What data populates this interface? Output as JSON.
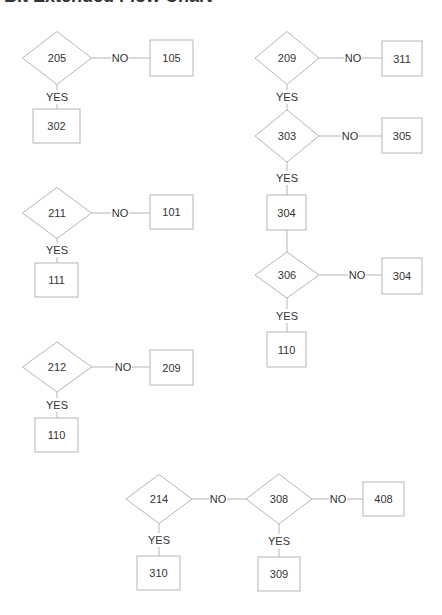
{
  "title": "Bit Extended Flow Chart",
  "colors": {
    "stroke": "#b5b5b5",
    "text": "#333333",
    "background": "#ffffff"
  },
  "nodes": [
    {
      "id": "d205",
      "type": "decision",
      "label": "205",
      "cx": 57,
      "cy": 58,
      "w": 69,
      "h": 53
    },
    {
      "id": "b105",
      "type": "process",
      "label": "105",
      "x": 150,
      "y": 40,
      "w": 43,
      "h": 36
    },
    {
      "id": "b302",
      "type": "process",
      "label": "302",
      "x": 33,
      "y": 109,
      "w": 47,
      "h": 34
    },
    {
      "id": "d211",
      "type": "decision",
      "label": "211",
      "cx": 57,
      "cy": 213,
      "w": 69,
      "h": 51
    },
    {
      "id": "b101",
      "type": "process",
      "label": "101",
      "x": 150,
      "y": 195,
      "w": 43,
      "h": 34
    },
    {
      "id": "b111",
      "type": "process",
      "label": "111",
      "x": 35,
      "y": 263,
      "w": 43,
      "h": 34
    },
    {
      "id": "d212",
      "type": "decision",
      "label": "212",
      "cx": 57,
      "cy": 367,
      "w": 69,
      "h": 50
    },
    {
      "id": "b209",
      "type": "process",
      "label": "209",
      "x": 150,
      "y": 350,
      "w": 43,
      "h": 35
    },
    {
      "id": "b110a",
      "type": "process",
      "label": "110",
      "x": 35,
      "y": 418,
      "w": 43,
      "h": 34
    },
    {
      "id": "d209",
      "type": "decision",
      "label": "209",
      "cx": 287,
      "cy": 58,
      "w": 64,
      "h": 53
    },
    {
      "id": "b311",
      "type": "process",
      "label": "311",
      "x": 382,
      "y": 41,
      "w": 40,
      "h": 35
    },
    {
      "id": "d303",
      "type": "decision",
      "label": "303",
      "cx": 287,
      "cy": 136,
      "w": 64,
      "h": 52
    },
    {
      "id": "b305",
      "type": "process",
      "label": "305",
      "x": 382,
      "y": 118,
      "w": 40,
      "h": 35
    },
    {
      "id": "b304a",
      "type": "process",
      "label": "304",
      "x": 267,
      "y": 195,
      "w": 39,
      "h": 35
    },
    {
      "id": "d306",
      "type": "decision",
      "label": "306",
      "cx": 287,
      "cy": 275,
      "w": 64,
      "h": 46
    },
    {
      "id": "b304b",
      "type": "process",
      "label": "304",
      "x": 382,
      "y": 258,
      "w": 40,
      "h": 36
    },
    {
      "id": "b110b",
      "type": "process",
      "label": "110",
      "x": 267,
      "y": 332,
      "w": 39,
      "h": 35
    },
    {
      "id": "d214",
      "type": "decision",
      "label": "214",
      "cx": 159,
      "cy": 499,
      "w": 66,
      "h": 49
    },
    {
      "id": "d308",
      "type": "decision",
      "label": "308",
      "cx": 279,
      "cy": 499,
      "w": 66,
      "h": 50
    },
    {
      "id": "b408",
      "type": "process",
      "label": "408",
      "x": 363,
      "y": 482,
      "w": 41,
      "h": 34
    },
    {
      "id": "b310",
      "type": "process",
      "label": "310",
      "x": 137,
      "y": 556,
      "w": 43,
      "h": 34
    },
    {
      "id": "b309",
      "type": "process",
      "label": "309",
      "x": 258,
      "y": 557,
      "w": 42,
      "h": 34
    }
  ],
  "edges": [
    {
      "from": "d205",
      "to": "b105",
      "label": "NO",
      "x1": 91,
      "y1": 58,
      "x2": 150,
      "y2": 58,
      "lx": 120,
      "ly": 58
    },
    {
      "from": "d205",
      "to": "b302",
      "label": "YES",
      "x1": 57,
      "y1": 85,
      "x2": 57,
      "y2": 109,
      "lx": 57,
      "ly": 97
    },
    {
      "from": "d211",
      "to": "b101",
      "label": "NO",
      "x1": 91,
      "y1": 213,
      "x2": 150,
      "y2": 213,
      "lx": 120,
      "ly": 213
    },
    {
      "from": "d211",
      "to": "b111",
      "label": "YES",
      "x1": 57,
      "y1": 238,
      "x2": 57,
      "y2": 263,
      "lx": 57,
      "ly": 250
    },
    {
      "from": "d212",
      "to": "b209",
      "label": "NO",
      "x1": 91,
      "y1": 367,
      "x2": 150,
      "y2": 367,
      "lx": 123,
      "ly": 367
    },
    {
      "from": "d212",
      "to": "b110a",
      "label": "YES",
      "x1": 57,
      "y1": 392,
      "x2": 57,
      "y2": 418,
      "lx": 57,
      "ly": 405
    },
    {
      "from": "d209",
      "to": "b311",
      "label": "NO",
      "x1": 319,
      "y1": 58,
      "x2": 382,
      "y2": 58,
      "lx": 353,
      "ly": 58
    },
    {
      "from": "d209",
      "to": "d303",
      "label": "YES",
      "x1": 287,
      "y1": 85,
      "x2": 287,
      "y2": 110,
      "lx": 287,
      "ly": 97
    },
    {
      "from": "d303",
      "to": "b305",
      "label": "NO",
      "x1": 319,
      "y1": 136,
      "x2": 382,
      "y2": 136,
      "lx": 350,
      "ly": 136
    },
    {
      "from": "d303",
      "to": "b304a",
      "label": "YES",
      "x1": 287,
      "y1": 162,
      "x2": 287,
      "y2": 195,
      "lx": 287,
      "ly": 178
    },
    {
      "from": "b304a",
      "to": "d306",
      "label": "",
      "x1": 287,
      "y1": 230,
      "x2": 287,
      "y2": 252,
      "lx": 0,
      "ly": 0
    },
    {
      "from": "d306",
      "to": "b304b",
      "label": "NO",
      "x1": 319,
      "y1": 275,
      "x2": 382,
      "y2": 275,
      "lx": 357,
      "ly": 275
    },
    {
      "from": "d306",
      "to": "b110b",
      "label": "YES",
      "x1": 287,
      "y1": 298,
      "x2": 287,
      "y2": 332,
      "lx": 287,
      "ly": 316
    },
    {
      "from": "d214",
      "to": "d308",
      "label": "NO",
      "x1": 192,
      "y1": 499,
      "x2": 246,
      "y2": 499,
      "lx": 218,
      "ly": 499
    },
    {
      "from": "d214",
      "to": "b310",
      "label": "YES",
      "x1": 159,
      "y1": 523,
      "x2": 159,
      "y2": 556,
      "lx": 159,
      "ly": 540
    },
    {
      "from": "d308",
      "to": "b408",
      "label": "NO",
      "x1": 312,
      "y1": 499,
      "x2": 363,
      "y2": 499,
      "lx": 338,
      "ly": 499
    },
    {
      "from": "d308",
      "to": "b309",
      "label": "YES",
      "x1": 279,
      "y1": 524,
      "x2": 279,
      "y2": 557,
      "lx": 279,
      "ly": 541
    }
  ]
}
